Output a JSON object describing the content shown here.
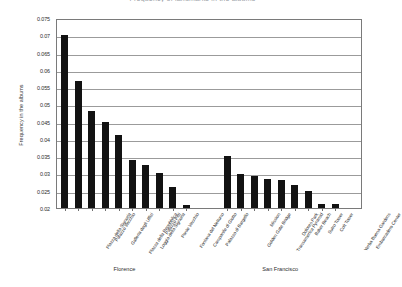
{
  "chart_data": {
    "type": "bar",
    "title": "Frequency of landmarks in the albums",
    "xlabel": "",
    "ylabel": "Frequency in the albums",
    "ylim": [
      0.02,
      0.075
    ],
    "ytick_step": 0.005,
    "grid": true,
    "legend": false,
    "yticks": [
      "0.02",
      "0.025",
      "0.03",
      "0.035",
      "0.04",
      "0.045",
      "0.05",
      "0.055",
      "0.06",
      "0.065",
      "0.07",
      "0.075"
    ],
    "groups": [
      {
        "name": "Florence",
        "label": "Florence"
      },
      {
        "name": "San Francisco",
        "label": "San Francisco"
      }
    ],
    "categories": [
      "Piazza della Signoria",
      "Palazzo Vecchio",
      "Galleria degli Uffizi",
      "Piazza della Repubblica",
      "Loggia della Signoria",
      "Palazzo Pitti",
      "Ponte Vecchio",
      "Fontana del Nettuno",
      "Campanile di Giotto",
      "Palazzo di Bargello",
      "Golden Gate Bridge",
      "Mission",
      "Transamerica Pyramid",
      "Dolores Park",
      "Baker Beach",
      "Sutro Tower",
      "Coit Tower",
      "Yerba Buena Gardens",
      "Embarcadero Center"
    ],
    "values": [
      0.07,
      0.0567,
      0.048,
      0.045,
      0.0412,
      0.034,
      0.0325,
      0.03,
      0.0262,
      0.0208,
      0.035,
      0.0298,
      0.0292,
      0.0283,
      0.028,
      0.0268,
      0.0248,
      0.0213,
      0.0212
    ],
    "bar_color": "#121212",
    "axis_color": "#7a7a7a",
    "grid_color": "#9b9b9b"
  }
}
